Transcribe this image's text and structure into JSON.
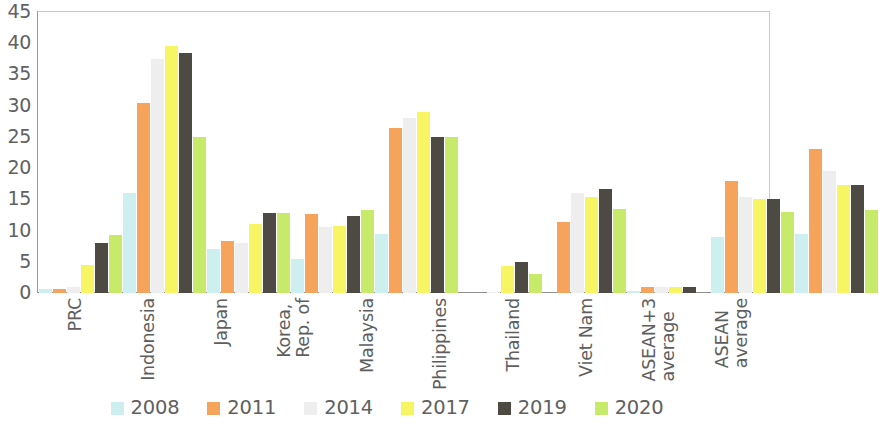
{
  "chart_data": {
    "type": "bar",
    "title": "",
    "subtitle": "",
    "xlabel": "",
    "ylabel": "",
    "ylim": [
      0,
      45
    ],
    "ytick_step": 5,
    "ytick_labels": [
      "45",
      "40",
      "35",
      "30",
      "25",
      "20",
      "15",
      "10",
      "5",
      "0"
    ],
    "grid": false,
    "legend_position": "bottom",
    "categories": [
      "PRC",
      "Indonesia",
      "Japan",
      "Korea,\nRep. of",
      "Malaysia",
      "Philippines",
      "Thailand",
      "Viet Nam",
      "ASEAN+3\naverage",
      "ASEAN\naverage"
    ],
    "series": [
      {
        "name": "2008",
        "color": "#cdeff0",
        "values": [
          0.6,
          16.0,
          7.0,
          5.5,
          9.5,
          0.0,
          0.0,
          0.4,
          9.0,
          9.5
        ]
      },
      {
        "name": "2011",
        "color": "#f6a45c",
        "values": [
          0.7,
          30.5,
          8.3,
          12.7,
          26.5,
          0.0,
          11.3,
          0.9,
          18.0,
          23.0
        ]
      },
      {
        "name": "2014",
        "color": "#eeeeee",
        "values": [
          1.0,
          37.5,
          8.0,
          10.5,
          28.0,
          0.2,
          16.0,
          0.9,
          15.3,
          19.5
        ]
      },
      {
        "name": "2017",
        "color": "#f8f564",
        "values": [
          4.5,
          39.5,
          11.0,
          10.8,
          29.0,
          4.3,
          15.3,
          0.9,
          15.0,
          17.3
        ]
      },
      {
        "name": "2019",
        "color": "#4d4a44",
        "values": [
          8.0,
          38.5,
          12.8,
          12.3,
          25.0,
          5.0,
          16.7,
          1.0,
          15.0,
          17.3
        ]
      },
      {
        "name": "2020",
        "color": "#c7ea6a",
        "values": [
          9.3,
          25.0,
          12.8,
          13.3,
          25.0,
          3.0,
          13.4,
          0.0,
          13.0,
          13.3
        ]
      }
    ]
  }
}
